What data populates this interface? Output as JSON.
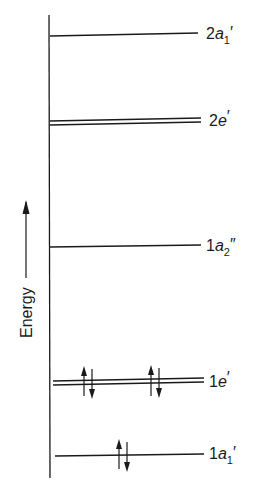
{
  "diagram": {
    "type": "molecular-orbital-energy-level-diagram",
    "axis_label": "Energy",
    "levels": [
      {
        "label_num": "2",
        "label_sym": "a",
        "label_sub": "1",
        "label_prime": "′",
        "degenerate": false,
        "electrons": 0
      },
      {
        "label_num": "2",
        "label_sym": "e",
        "label_sub": "",
        "label_prime": "′",
        "degenerate": true,
        "electrons": 0
      },
      {
        "label_num": "1",
        "label_sym": "a",
        "label_sub": "2",
        "label_prime": "″",
        "degenerate": false,
        "electrons": 0
      },
      {
        "label_num": "1",
        "label_sym": "e",
        "label_sub": "",
        "label_prime": "′",
        "degenerate": true,
        "electrons": 4
      },
      {
        "label_num": "1",
        "label_sym": "a",
        "label_sub": "1",
        "label_prime": "′",
        "degenerate": false,
        "electrons": 2
      }
    ]
  },
  "colors": {
    "ink": "#1a1a1a",
    "background": "#ffffff"
  }
}
